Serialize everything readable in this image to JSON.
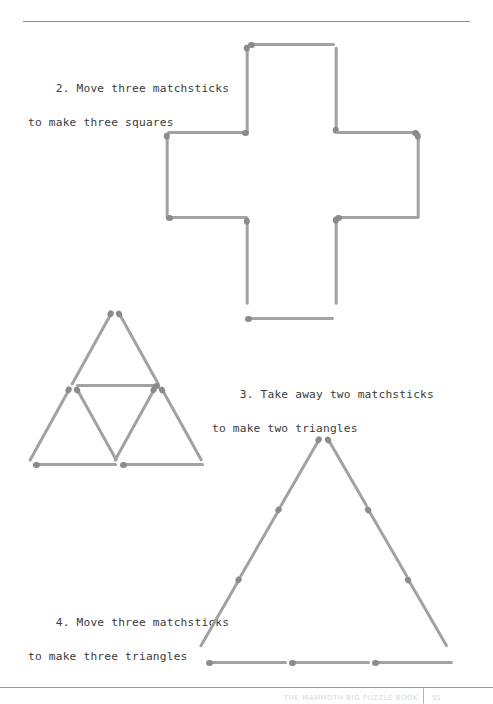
{
  "page": {
    "background_color": "#ffffff",
    "text_color": "#3b3b3b",
    "stick_color": "#a2a2a2",
    "stick_head_color": "#8b8b8b",
    "rule_color": "#8c8c8c"
  },
  "puzzles": [
    {
      "id": "puzzle-2",
      "number": "2.",
      "line1": "2. Move three matchsticks",
      "line2": "to make three squares",
      "figure": "cross-of-twelve-matchsticks",
      "matchstick_count": 12
    },
    {
      "id": "puzzle-3",
      "number": "3.",
      "line1": "3. Take away two matchsticks",
      "line2": "to make two triangles",
      "figure": "three-small-triangles",
      "matchstick_count": 9
    },
    {
      "id": "puzzle-4",
      "number": "4.",
      "line1": "4. Move three matchsticks",
      "line2": "to make three triangles",
      "figure": "large-triangle-nine-matchsticks",
      "matchstick_count": 9
    }
  ],
  "footer": {
    "text": "THE MAMMOTH BIG PUZZLE BOOK",
    "page_number": "91"
  }
}
